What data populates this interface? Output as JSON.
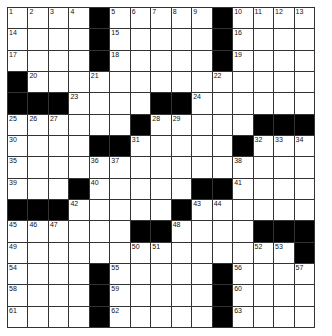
{
  "puzzle": {
    "rows": 15,
    "cols": 15,
    "layout": [
      "....#.....#....",
      "....#.....#....",
      "....#.....#....",
      "#..............",
      "###....##......",
      "......#.....###",
      "....##.....#...",
      "...............",
      "...#.....##....",
      "###.....#......",
      "......##....###",
      "..............#",
      "....#.....#....",
      "....#.....#....",
      "....#.....#...."
    ],
    "numbers": [
      {
        "r": 0,
        "c": 0,
        "n": "1"
      },
      {
        "r": 0,
        "c": 1,
        "n": "2"
      },
      {
        "r": 0,
        "c": 2,
        "n": "3"
      },
      {
        "r": 0,
        "c": 3,
        "n": "4"
      },
      {
        "r": 0,
        "c": 5,
        "n": "5"
      },
      {
        "r": 0,
        "c": 6,
        "n": "6"
      },
      {
        "r": 0,
        "c": 7,
        "n": "7"
      },
      {
        "r": 0,
        "c": 8,
        "n": "8"
      },
      {
        "r": 0,
        "c": 9,
        "n": "9"
      },
      {
        "r": 0,
        "c": 11,
        "n": "10"
      },
      {
        "r": 0,
        "c": 12,
        "n": "11"
      },
      {
        "r": 0,
        "c": 13,
        "n": "12"
      },
      {
        "r": 0,
        "c": 14,
        "n": "13"
      },
      {
        "r": 1,
        "c": 0,
        "n": "14"
      },
      {
        "r": 1,
        "c": 5,
        "n": "15"
      },
      {
        "r": 1,
        "c": 11,
        "n": "16"
      },
      {
        "r": 2,
        "c": 0,
        "n": "17"
      },
      {
        "r": 2,
        "c": 5,
        "n": "18"
      },
      {
        "r": 2,
        "c": 11,
        "n": "19"
      },
      {
        "r": 3,
        "c": 1,
        "n": "20"
      },
      {
        "r": 3,
        "c": 4,
        "n": "21"
      },
      {
        "r": 3,
        "c": 10,
        "n": "22"
      },
      {
        "r": 4,
        "c": 3,
        "n": "23"
      },
      {
        "r": 4,
        "c": 9,
        "n": "24"
      },
      {
        "r": 5,
        "c": 0,
        "n": "25"
      },
      {
        "r": 5,
        "c": 1,
        "n": "26"
      },
      {
        "r": 5,
        "c": 2,
        "n": "27"
      },
      {
        "r": 5,
        "c": 7,
        "n": "28"
      },
      {
        "r": 5,
        "c": 8,
        "n": "29"
      },
      {
        "r": 6,
        "c": 0,
        "n": "30"
      },
      {
        "r": 6,
        "c": 6,
        "n": "31"
      },
      {
        "r": 6,
        "c": 12,
        "n": "32"
      },
      {
        "r": 6,
        "c": 13,
        "n": "33"
      },
      {
        "r": 6,
        "c": 14,
        "n": "34"
      },
      {
        "r": 7,
        "c": 0,
        "n": "35"
      },
      {
        "r": 7,
        "c": 4,
        "n": "36"
      },
      {
        "r": 7,
        "c": 5,
        "n": "37"
      },
      {
        "r": 7,
        "c": 11,
        "n": "38"
      },
      {
        "r": 8,
        "c": 0,
        "n": "39"
      },
      {
        "r": 8,
        "c": 4,
        "n": "40"
      },
      {
        "r": 8,
        "c": 11,
        "n": "41"
      },
      {
        "r": 9,
        "c": 3,
        "n": "42"
      },
      {
        "r": 9,
        "c": 9,
        "n": "43"
      },
      {
        "r": 9,
        "c": 10,
        "n": "44"
      },
      {
        "r": 10,
        "c": 0,
        "n": "45"
      },
      {
        "r": 10,
        "c": 1,
        "n": "46"
      },
      {
        "r": 10,
        "c": 2,
        "n": "47"
      },
      {
        "r": 10,
        "c": 8,
        "n": "48"
      },
      {
        "r": 11,
        "c": 0,
        "n": "49"
      },
      {
        "r": 11,
        "c": 6,
        "n": "50"
      },
      {
        "r": 11,
        "c": 7,
        "n": "51"
      },
      {
        "r": 11,
        "c": 12,
        "n": "52"
      },
      {
        "r": 11,
        "c": 13,
        "n": "53"
      },
      {
        "r": 12,
        "c": 0,
        "n": "54"
      },
      {
        "r": 12,
        "c": 5,
        "n": "55"
      },
      {
        "r": 12,
        "c": 11,
        "n": "56"
      },
      {
        "r": 12,
        "c": 14,
        "n": "57"
      },
      {
        "r": 13,
        "c": 0,
        "n": "58"
      },
      {
        "r": 13,
        "c": 5,
        "n": "59"
      },
      {
        "r": 13,
        "c": 11,
        "n": "60"
      },
      {
        "r": 14,
        "c": 0,
        "n": "61"
      },
      {
        "r": 14,
        "c": 5,
        "n": "62"
      },
      {
        "r": 14,
        "c": 11,
        "n": "63"
      }
    ]
  },
  "colors": {
    "block": "#000000",
    "cell": "#ffffff",
    "line": "#333333"
  }
}
